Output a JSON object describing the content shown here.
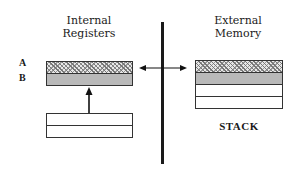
{
  "internal": {
    "heading_line1": "Internal",
    "heading_line2": "Registers",
    "register_labels": [
      "A",
      "B"
    ]
  },
  "external": {
    "heading_line1": "External",
    "heading_line2": "Memory",
    "stack_label": "STACK"
  },
  "colors": {
    "divider": "#1a1a1a",
    "register_b_fill": "#b9b9b9",
    "hatch": "#777777"
  }
}
